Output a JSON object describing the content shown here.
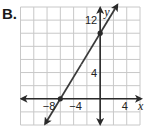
{
  "problem_label": "B.",
  "chart_data": {
    "type": "line",
    "title": "",
    "xlabel": "x",
    "ylabel": "y",
    "xlim": [
      -12,
      6
    ],
    "ylim": [
      -4,
      14
    ],
    "grid": true,
    "grid_step": 2,
    "x_tick_labels": [
      {
        "value": -8,
        "text": "−8"
      },
      {
        "value": -4,
        "text": "−4"
      },
      {
        "value": 4,
        "text": "4"
      }
    ],
    "y_tick_labels": [
      {
        "value": 4,
        "text": "4"
      },
      {
        "value": 12,
        "text": "12"
      }
    ],
    "series": [
      {
        "name": "line",
        "equation": "y = (5/3)x + 10",
        "points": [
          {
            "x": -6,
            "y": 0
          },
          {
            "x": 0,
            "y": 10
          }
        ],
        "x_intercept": -6,
        "y_intercept": 10,
        "arrows": "both"
      }
    ],
    "colors": {
      "line": "#3a3a3a",
      "axis": "#2a2a2a",
      "grid": "#c8c8c8"
    }
  }
}
